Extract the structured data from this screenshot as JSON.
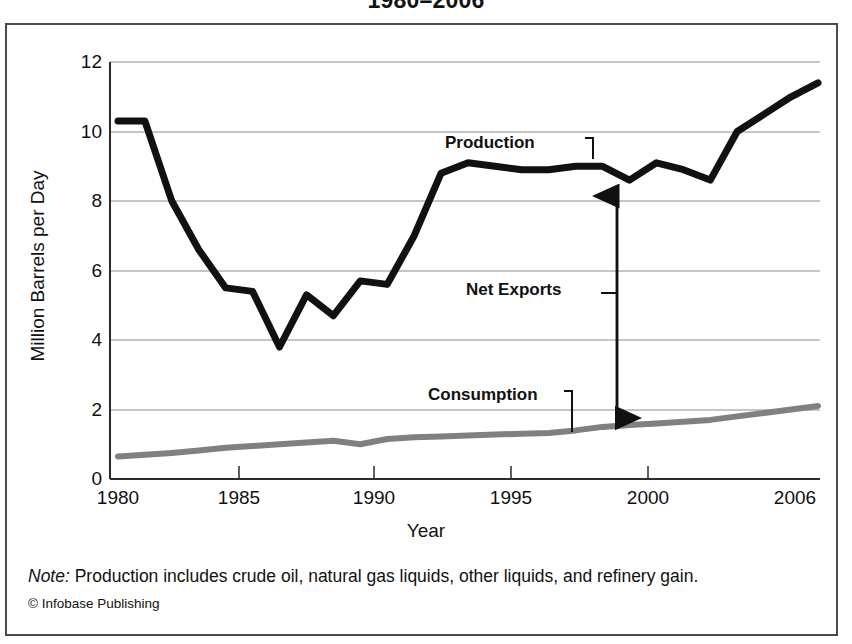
{
  "title": "1980–2006",
  "axis": {
    "ylabel": "Million Barrels per Day",
    "xlabel": "Year",
    "yticks": [
      "0",
      "2",
      "4",
      "6",
      "8",
      "10",
      "12"
    ],
    "xticks": [
      "1980",
      "1985",
      "1990",
      "1995",
      "2000",
      "2006"
    ]
  },
  "annotations": {
    "production": "Production",
    "net_exports": "Net Exports",
    "consumption": "Consumption"
  },
  "footnote": {
    "note_label": "Note:",
    "note_text": " Production includes crude oil, natural gas liquids, other liquids, and refinery gain.",
    "credit": "© Infobase Publishing"
  },
  "colors": {
    "production_line": "#111111",
    "consumption_line": "#808080",
    "grid": "#8c8c8c",
    "frame": "#4a4a4a",
    "text": "#111111"
  },
  "chart_data": {
    "type": "line",
    "title": "1980–2006",
    "xlabel": "Year",
    "ylabel": "Million Barrels per Day",
    "xlim": [
      1980,
      2006
    ],
    "ylim": [
      0,
      12
    ],
    "ytick_values": [
      0,
      2,
      4,
      6,
      8,
      10,
      12
    ],
    "xtick_values": [
      1980,
      1985,
      1990,
      1995,
      2000,
      2006
    ],
    "grid": "horizontal",
    "legend": "none (inline labels)",
    "x": [
      1980,
      1981,
      1982,
      1983,
      1984,
      1985,
      1986,
      1987,
      1988,
      1989,
      1990,
      1991,
      1992,
      1993,
      1994,
      1995,
      1996,
      1997,
      1998,
      1999,
      2000,
      2001,
      2002,
      2003,
      2004,
      2005,
      2006
    ],
    "series": [
      {
        "name": "Production",
        "color": "#111111",
        "values": [
          10.3,
          10.3,
          8.0,
          6.6,
          5.5,
          5.4,
          3.8,
          5.3,
          4.7,
          5.7,
          5.6,
          7.0,
          8.8,
          9.1,
          9.0,
          8.9,
          8.9,
          9.0,
          9.0,
          8.6,
          9.1,
          8.9,
          8.6,
          10.0,
          10.5,
          11.0,
          11.4
        ]
      },
      {
        "name": "Consumption",
        "color": "#808080",
        "values": [
          0.65,
          0.7,
          0.75,
          0.82,
          0.9,
          0.95,
          1.0,
          1.05,
          1.1,
          1.0,
          1.15,
          1.2,
          1.22,
          1.25,
          1.28,
          1.3,
          1.32,
          1.4,
          1.5,
          1.55,
          1.6,
          1.65,
          1.7,
          1.8,
          1.9,
          2.0,
          2.1
        ]
      }
    ],
    "annotations": [
      {
        "text": "Production",
        "x": 1996,
        "y": 9.9
      },
      {
        "text": "Net Exports",
        "x": 1997,
        "y": 5.6
      },
      {
        "text": "Consumption",
        "x": 1995.5,
        "y": 2.55
      }
    ]
  }
}
